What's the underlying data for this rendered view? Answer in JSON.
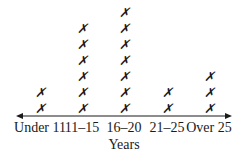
{
  "chart_data": {
    "type": "dot_plot",
    "title": "",
    "xlabel": "Years",
    "ylabel": "",
    "marker": "X",
    "categories": [
      "Under 11",
      "11–15",
      "16–20",
      "21–25",
      "Over 25"
    ],
    "values": [
      2,
      6,
      7,
      2,
      3
    ],
    "grid": false,
    "axis": {
      "arrows": "both ends"
    }
  },
  "colors": {
    "ink": "#1a1a1a",
    "background": "#ffffff"
  }
}
